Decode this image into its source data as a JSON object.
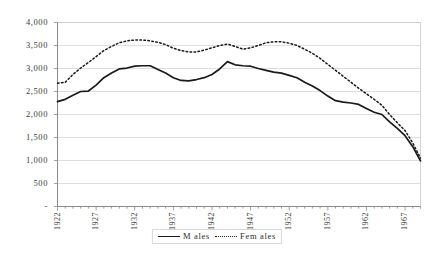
{
  "chart_data": {
    "type": "line",
    "title": "",
    "xlabel": "",
    "ylabel": "",
    "ylim": [
      0,
      4000
    ],
    "xlim": [
      1922,
      1969
    ],
    "grid": true,
    "legend_position": "bottom-center",
    "y_ticks": [
      "-",
      "500",
      "1,000",
      "1,500",
      "2,000",
      "2,500",
      "3,000",
      "3,500",
      "4,000"
    ],
    "y_tick_values": [
      0,
      500,
      1000,
      1500,
      2000,
      2500,
      3000,
      3500,
      4000
    ],
    "x_ticks": [
      "1922",
      "1927",
      "1932",
      "1937",
      "1942",
      "1947",
      "1952",
      "1957",
      "1962",
      "1967"
    ],
    "x_tick_values": [
      1922,
      1927,
      1932,
      1937,
      1942,
      1947,
      1952,
      1957,
      1962,
      1967
    ],
    "x": [
      1922,
      1923,
      1924,
      1925,
      1926,
      1927,
      1928,
      1929,
      1930,
      1931,
      1932,
      1933,
      1934,
      1935,
      1936,
      1937,
      1938,
      1939,
      1940,
      1941,
      1942,
      1943,
      1944,
      1945,
      1946,
      1947,
      1948,
      1949,
      1950,
      1951,
      1952,
      1953,
      1954,
      1955,
      1956,
      1957,
      1958,
      1959,
      1960,
      1961,
      1962,
      1963,
      1964,
      1965,
      1966,
      1967,
      1968,
      1969
    ],
    "series": [
      {
        "name": "M ales",
        "style": "solid",
        "color": "#1a1a1a",
        "values": [
          2280,
          2330,
          2420,
          2500,
          2510,
          2640,
          2800,
          2900,
          2990,
          3010,
          3050,
          3060,
          3060,
          2980,
          2900,
          2800,
          2740,
          2730,
          2760,
          2800,
          2870,
          2990,
          3150,
          3080,
          3060,
          3050,
          3000,
          2960,
          2920,
          2900,
          2850,
          2800,
          2700,
          2620,
          2520,
          2400,
          2300,
          2270,
          2250,
          2220,
          2130,
          2050,
          2000,
          1840,
          1700,
          1540,
          1300,
          990
        ]
      },
      {
        "name": "Fem ales",
        "style": "dotted",
        "color": "#1a1a1a",
        "values": [
          2680,
          2700,
          2870,
          3010,
          3130,
          3260,
          3390,
          3480,
          3560,
          3600,
          3620,
          3620,
          3600,
          3570,
          3520,
          3440,
          3390,
          3360,
          3360,
          3400,
          3450,
          3500,
          3530,
          3480,
          3420,
          3450,
          3500,
          3560,
          3580,
          3580,
          3550,
          3500,
          3420,
          3330,
          3220,
          3090,
          2960,
          2830,
          2700,
          2570,
          2450,
          2330,
          2200,
          2000,
          1820,
          1650,
          1380,
          1050
        ]
      }
    ]
  }
}
